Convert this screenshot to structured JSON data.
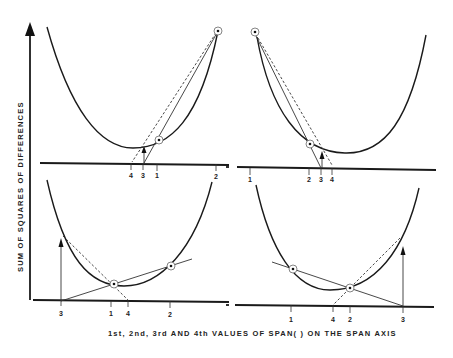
{
  "figure": {
    "y_axis_label": "SUM OF SQUARES OF DIFFERENCES",
    "x_axis_label": "1st, 2nd, 3rd AND 4th VALUES OF SPAN( ) ON THE SPAN AXIS",
    "panels": [
      {
        "id": "top-left",
        "ticks": [
          {
            "label": "4",
            "x": 131
          },
          {
            "label": "3",
            "x": 143
          },
          {
            "label": "1",
            "x": 157
          },
          {
            "label": "2",
            "x": 216
          }
        ],
        "points": [
          "1",
          "2"
        ],
        "description": "Secant through points at span 1 and 2 intersects axis at 3; dashed line gives 4"
      },
      {
        "id": "top-right",
        "ticks": [
          {
            "label": "1",
            "x": 250
          },
          {
            "label": "2",
            "x": 309
          },
          {
            "label": "3",
            "x": 321
          },
          {
            "label": "4",
            "x": 332
          }
        ],
        "points": [
          "1",
          "2"
        ],
        "description": "Secant through points at span 1 and 2 intersects axis at 3; dashed line gives 4"
      },
      {
        "id": "bottom-left",
        "ticks": [
          {
            "label": "3",
            "x": 61
          },
          {
            "label": "1",
            "x": 111
          },
          {
            "label": "4",
            "x": 128
          },
          {
            "label": "2",
            "x": 170
          }
        ],
        "points": [
          "1",
          "2"
        ],
        "description": "Line through points 1 and 2 extended to axis at 3; dashed line gives 4"
      },
      {
        "id": "bottom-right",
        "ticks": [
          {
            "label": "1",
            "x": 291
          },
          {
            "label": "4",
            "x": 333
          },
          {
            "label": "2",
            "x": 350
          },
          {
            "label": "3",
            "x": 403
          }
        ],
        "points": [
          "1",
          "2"
        ],
        "description": "Line through points 1 and 2 extended to axis at 3; dashed line gives 4"
      }
    ]
  }
}
